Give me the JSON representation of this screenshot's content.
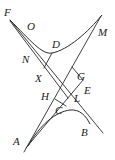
{
  "figure": {
    "type": "geometric-construction",
    "stroke_color": "#2a2a2a",
    "points": {
      "F": {
        "label": "F",
        "x": 10,
        "y": 20
      },
      "O": {
        "label": "O",
        "x": 27,
        "y": 30
      },
      "D": {
        "label": "D",
        "x": 50,
        "y": 52
      },
      "M": {
        "label": "M",
        "x": 101,
        "y": 16
      },
      "N": {
        "label": "N",
        "x": 30,
        "y": 55
      },
      "X": {
        "label": "X",
        "x": 42,
        "y": 66
      },
      "G": {
        "label": "G",
        "x": 73,
        "y": 70
      },
      "E": {
        "label": "E",
        "x": 83,
        "y": 80
      },
      "H": {
        "label": "H",
        "x": 55,
        "y": 97
      },
      "L": {
        "label": "L",
        "x": 67,
        "y": 96
      },
      "C": {
        "label": "C",
        "x": 60,
        "y": 107
      },
      "B": {
        "label": "B",
        "x": 88,
        "y": 124
      },
      "A": {
        "label": "A",
        "x": 28,
        "y": 145
      }
    },
    "labels": [
      {
        "id": "F",
        "text": "F",
        "x": 4,
        "y": 16
      },
      {
        "id": "O",
        "text": "O",
        "x": 27,
        "y": 30
      },
      {
        "id": "M",
        "text": "M",
        "x": 98,
        "y": 36
      },
      {
        "id": "D",
        "text": "D",
        "x": 52,
        "y": 48
      },
      {
        "id": "N",
        "text": "N",
        "x": 22,
        "y": 63
      },
      {
        "id": "X",
        "text": "X",
        "x": 35,
        "y": 82
      },
      {
        "id": "G",
        "text": "G",
        "x": 77,
        "y": 80
      },
      {
        "id": "E",
        "text": "E",
        "x": 84,
        "y": 94
      },
      {
        "id": "H",
        "text": "H",
        "x": 41,
        "y": 100
      },
      {
        "id": "L",
        "text": "L",
        "x": 74,
        "y": 102
      },
      {
        "id": "C",
        "text": "C",
        "x": 55,
        "y": 114
      },
      {
        "id": "B",
        "text": "B",
        "x": 81,
        "y": 136
      },
      {
        "id": "A",
        "text": "A",
        "x": 13,
        "y": 145
      }
    ]
  }
}
